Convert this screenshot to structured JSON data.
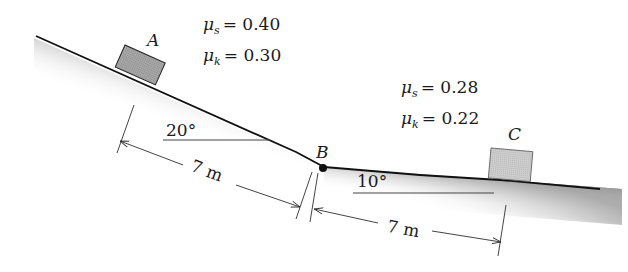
{
  "diagram": {
    "type": "inclined-plane-friction",
    "blocks": [
      {
        "label": "A",
        "position": "upper slope"
      },
      {
        "label": "C",
        "position": "lower slope"
      }
    ],
    "point": {
      "label": "B"
    },
    "segments": [
      {
        "angle": "20°",
        "length": "7 m",
        "friction": {
          "mu_s_label": "μ",
          "mu_s_sub": "s",
          "mu_s_value": "= 0.40",
          "mu_k_label": "μ",
          "mu_k_sub": "k",
          "mu_k_value": "= 0.30"
        }
      },
      {
        "angle": "10°",
        "length": "7 m",
        "friction": {
          "mu_s_label": "μ",
          "mu_s_sub": "s",
          "mu_s_value": "= 0.28",
          "mu_k_label": "μ",
          "mu_k_sub": "k",
          "mu_k_value": "= 0.22"
        }
      }
    ]
  }
}
